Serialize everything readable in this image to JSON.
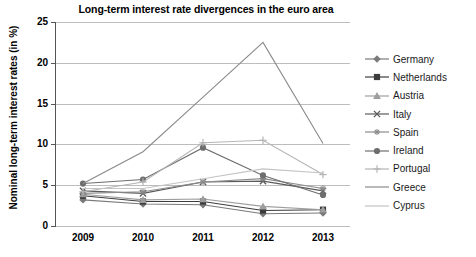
{
  "chart_data": {
    "type": "line",
    "title": "Long-term interest rate divergences in the euro area",
    "xlabel": "",
    "ylabel": "Nominal long-term interest rates (in %)",
    "categories": [
      "2009",
      "2010",
      "2011",
      "2012",
      "2013"
    ],
    "ylim": [
      0,
      25
    ],
    "yticks": [
      0,
      5,
      10,
      15,
      20,
      25
    ],
    "grid": true,
    "legend_position": "right",
    "series": [
      {
        "name": "Germany",
        "values": [
          3.2,
          2.7,
          2.6,
          1.5,
          1.6
        ],
        "color": "#7a7a7a",
        "marker": "diamond"
      },
      {
        "name": "Netherlands",
        "values": [
          3.7,
          3.0,
          3.0,
          1.9,
          2.0
        ],
        "color": "#3d3d3d",
        "marker": "square"
      },
      {
        "name": "Austria",
        "values": [
          3.9,
          3.2,
          3.3,
          2.4,
          2.0
        ],
        "color": "#9e9e9e",
        "marker": "triangle"
      },
      {
        "name": "Italy",
        "values": [
          4.3,
          4.0,
          5.4,
          5.5,
          4.3
        ],
        "color": "#5a5a5a",
        "marker": "cross"
      },
      {
        "name": "Spain",
        "values": [
          4.0,
          4.2,
          5.4,
          5.8,
          4.6
        ],
        "color": "#8d8d8d",
        "marker": "asterisk"
      },
      {
        "name": "Ireland",
        "values": [
          5.2,
          5.7,
          9.6,
          6.2,
          3.8
        ],
        "color": "#6e6e6e",
        "marker": "circle"
      },
      {
        "name": "Portugal",
        "values": [
          4.2,
          5.4,
          10.2,
          10.5,
          6.3
        ],
        "color": "#b5b5b5",
        "marker": "plus"
      },
      {
        "name": "Greece",
        "values": [
          5.2,
          9.1,
          15.8,
          22.5,
          10.1
        ],
        "color": "#8a8a8a",
        "marker": "none"
      },
      {
        "name": "Cyprus",
        "values": [
          4.6,
          4.6,
          5.8,
          7.0,
          6.5
        ],
        "color": "#c4c4c4",
        "marker": "none"
      }
    ]
  },
  "legend": {
    "items": [
      {
        "label": "Germany"
      },
      {
        "label": "Netherlands"
      },
      {
        "label": "Austria"
      },
      {
        "label": "Italy"
      },
      {
        "label": "Spain"
      },
      {
        "label": "Ireland"
      },
      {
        "label": "Portugal"
      },
      {
        "label": "Greece"
      },
      {
        "label": "Cyprus"
      }
    ]
  }
}
